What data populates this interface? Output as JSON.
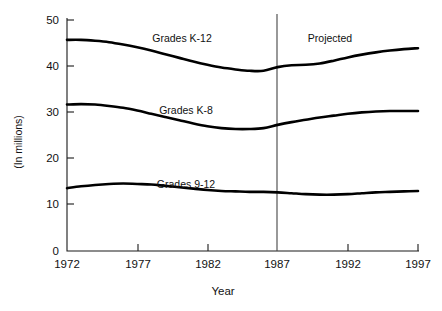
{
  "chart_data": {
    "type": "line",
    "title": "",
    "xlabel": "Year",
    "ylabel": "(In millions)",
    "xlim": [
      1972,
      1997
    ],
    "ylim": [
      0,
      50
    ],
    "grid": false,
    "legend_position": "inline-labels",
    "xticks": [
      1972,
      1977,
      1982,
      1987,
      1992,
      1997
    ],
    "yticks": [
      0,
      10,
      20,
      30,
      40,
      50
    ],
    "annotations": [
      {
        "text": "Projected",
        "x": 1990.5,
        "y": 45.2,
        "note": "label to the right of the vertical divider at 1987"
      }
    ],
    "vertical_divider": {
      "x": 1987,
      "label": "Projected",
      "color": "#444444"
    },
    "x": [
      1972,
      1973,
      1974,
      1975,
      1976,
      1977,
      1978,
      1979,
      1980,
      1981,
      1982,
      1983,
      1984,
      1985,
      1986,
      1987,
      1988,
      1989,
      1990,
      1991,
      1992,
      1993,
      1994,
      1995,
      1996,
      1997
    ],
    "series": [
      {
        "name": "Grades K-12",
        "label_x": 1985.0,
        "label_y": 45.6,
        "color": "#000000",
        "values": [
          45.7,
          45.7,
          45.5,
          45.2,
          44.7,
          44.1,
          43.4,
          42.6,
          41.8,
          41.0,
          40.3,
          39.7,
          39.3,
          39.0,
          39.0,
          39.8,
          40.2,
          40.3,
          40.6,
          41.2,
          41.9,
          42.5,
          43.0,
          43.4,
          43.7,
          43.9
        ]
      },
      {
        "name": "Grades K-8",
        "label_x": 1985.0,
        "label_y": 31.5,
        "color": "#000000",
        "values": [
          31.7,
          31.8,
          31.7,
          31.4,
          31.0,
          30.4,
          29.7,
          29.0,
          28.3,
          27.6,
          27.0,
          26.6,
          26.4,
          26.4,
          26.6,
          27.3,
          27.9,
          28.4,
          28.9,
          29.3,
          29.7,
          30.0,
          30.2,
          30.3,
          30.3,
          30.3
        ]
      },
      {
        "name": "Grades 9-12",
        "label_x": 1985.0,
        "label_y": 18.8,
        "color": "#000000",
        "values": [
          13.6,
          14.0,
          14.3,
          14.5,
          14.6,
          14.5,
          14.4,
          14.1,
          13.8,
          13.5,
          13.2,
          13.0,
          12.9,
          12.8,
          12.8,
          12.7,
          12.5,
          12.3,
          12.2,
          12.2,
          12.3,
          12.5,
          12.7,
          12.8,
          12.9,
          13.0
        ]
      }
    ]
  },
  "labels": {
    "y_axis_title": "(In millions)",
    "x_axis_title": "Year",
    "projected_note": "Projected",
    "series_k12": "Grades K-12",
    "series_k8": "Grades K-8",
    "series_912": "Grades 9-12"
  },
  "ticks": {
    "y": [
      "50",
      "40",
      "30",
      "20",
      "10",
      "0"
    ],
    "x": [
      "1972",
      "1977",
      "1982",
      "1987",
      "1992",
      "1997"
    ]
  },
  "colors": {
    "curve": "#000000",
    "axis": "#1a1a1a",
    "divider": "#444444",
    "background": "#ffffff"
  }
}
